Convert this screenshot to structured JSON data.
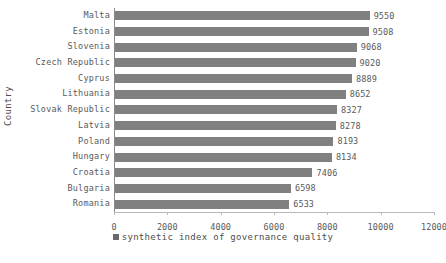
{
  "chart_data": {
    "type": "bar",
    "orientation": "horizontal",
    "title": "",
    "xlabel": "",
    "ylabel": "Country",
    "categories": [
      "Malta",
      "Estonia",
      "Slovenia",
      "Czech Republic",
      "Cyprus",
      "Lithuania",
      "Slovak Republic",
      "Latvia",
      "Poland",
      "Hungary",
      "Croatia",
      "Bulgaria",
      "Romania"
    ],
    "values": [
      9550,
      9508,
      9068,
      9020,
      8889,
      8652,
      8327,
      8278,
      8193,
      8134,
      7406,
      6598,
      6533
    ],
    "series": [
      {
        "name": "synthetic index of governance quality",
        "values": [
          9550,
          9508,
          9068,
          9020,
          8889,
          8652,
          8327,
          8278,
          8193,
          8134,
          7406,
          6598,
          6533
        ],
        "color": "#808080"
      }
    ],
    "xlim": [
      0,
      12000
    ],
    "xticks": [
      0,
      2000,
      4000,
      6000,
      8000,
      10000,
      12000
    ],
    "xtick_labels": [
      "0",
      "2000",
      "4000",
      "6000",
      "8000",
      "10000",
      "12000"
    ],
    "grid": false,
    "data_labels": true,
    "legend": {
      "position": "bottom",
      "entries": [
        "synthetic index of governance quality"
      ]
    },
    "colors": {
      "bar": "#808080",
      "legend_swatch": "#696969",
      "text": "#5a5a5a",
      "axis": "#8a8a8a",
      "background": "#ffffff"
    }
  },
  "axis": {
    "y_title": "Country"
  },
  "legend": {
    "label": "synthetic index of governance quality"
  }
}
